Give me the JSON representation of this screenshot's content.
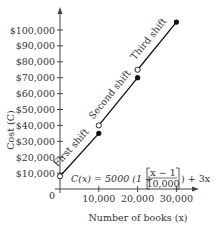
{
  "chart_data": {
    "type": "line",
    "title": "",
    "xlabel": "Number of books (x)",
    "ylabel": "Cost (C)",
    "x_ticks": [
      "0",
      "10,000",
      "20,000",
      "30,000"
    ],
    "y_ticks": [
      "$10,000",
      "$20,000",
      "$30,000",
      "$40,000",
      "$50,000",
      "$60,000",
      "$70,000",
      "$80,000",
      "$90,000",
      "$100,000"
    ],
    "xlim": [
      0,
      33000
    ],
    "ylim": [
      0,
      110000
    ],
    "series": [
      {
        "name": "First shift",
        "x": [
          1,
          10000
        ],
        "y": [
          8003,
          35000
        ],
        "start": "open",
        "end": "closed"
      },
      {
        "name": "Second shift",
        "x": [
          10001,
          20000
        ],
        "y": [
          40003,
          70000
        ],
        "start": "open",
        "end": "closed"
      },
      {
        "name": "Third shift",
        "x": [
          20001,
          30000
        ],
        "y": [
          75003,
          105000
        ],
        "start": "open",
        "end": "closed"
      }
    ],
    "annotations": [
      "First shift",
      "Second shift",
      "Third shift",
      "C(x) = 5000 (1 + [(x − 1)/10,000]) + 3x"
    ],
    "grid": false
  },
  "labels": {
    "zero": "0",
    "ylabel": "Cost (C)",
    "xlabel": "Number of books (x)",
    "formula_left": "C(x) = 5000 (1 +",
    "formula_num": "x − 1",
    "formula_den": "10,000",
    "formula_right": ") + 3x"
  }
}
